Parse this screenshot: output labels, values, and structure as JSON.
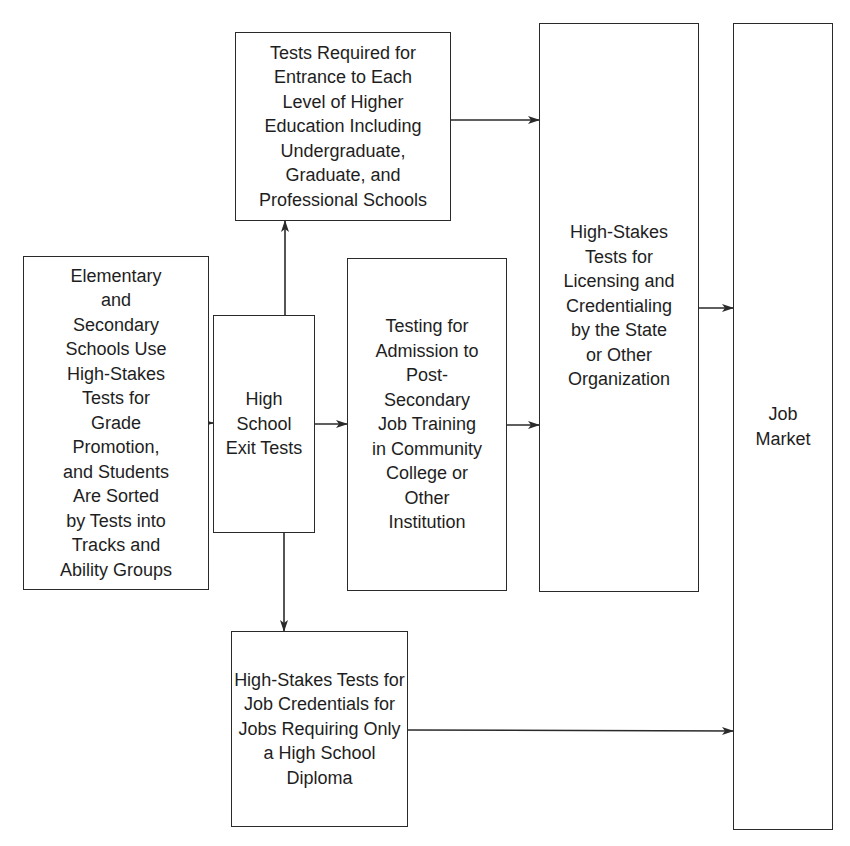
{
  "diagram": {
    "type": "flowchart",
    "nodes": {
      "elementary_secondary": {
        "label": "Elementary\nand\nSecondary\nSchools Use\nHigh-Stakes\nTests for\nGrade\nPromotion,\nand Students\nAre Sorted\nby Tests into\nTracks and\nAbility Groups"
      },
      "high_school_exit": {
        "label": "High\nSchool\nExit Tests"
      },
      "higher_education_entrance": {
        "label": "Tests Required for\nEntrance to Each\nLevel of Higher\nEducation Including\nUndergraduate,\nGraduate, and\nProfessional Schools"
      },
      "post_secondary_training": {
        "label": "Testing for\nAdmission to\nPost-\nSecondary\nJob Training\nin Community\nCollege or\nOther\nInstitution"
      },
      "job_credentials_hs": {
        "label": "High-Stakes Tests for\nJob Credentials for\nJobs Requiring Only\na High School\nDiploma"
      },
      "licensing_credentialing": {
        "label": "High-Stakes\nTests for\nLicensing and\nCredentialing\nby the State\nor Other\nOrganization"
      },
      "job_market": {
        "label": "Job\nMarket"
      }
    },
    "edges": [
      {
        "from": "elementary_secondary",
        "to": "high_school_exit"
      },
      {
        "from": "high_school_exit",
        "to": "higher_education_entrance"
      },
      {
        "from": "high_school_exit",
        "to": "post_secondary_training"
      },
      {
        "from": "high_school_exit",
        "to": "job_credentials_hs"
      },
      {
        "from": "higher_education_entrance",
        "to": "licensing_credentialing"
      },
      {
        "from": "post_secondary_training",
        "to": "licensing_credentialing"
      },
      {
        "from": "licensing_credentialing",
        "to": "job_market"
      },
      {
        "from": "job_credentials_hs",
        "to": "job_market"
      }
    ],
    "line_color": "#2a2a2a"
  }
}
